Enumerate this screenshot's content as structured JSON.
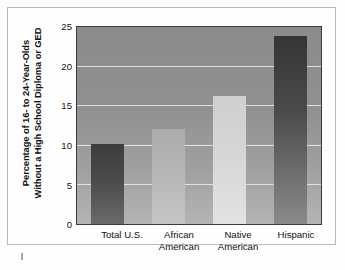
{
  "chart_data": {
    "type": "bar",
    "title": "",
    "xlabel": "",
    "ylabel": "Percentage of 16- to 24-Year-Olds Without a High School Diploma or GED",
    "ylabel_lines": [
      "Percentage of 16- to 24-Year-Olds",
      "Without a High School Diploma or GED"
    ],
    "categories": [
      "Total U.S.",
      "African American",
      "Native American",
      "Hispanic"
    ],
    "category_lines": [
      [
        "Total U.S.",
        ""
      ],
      [
        "African",
        "American"
      ],
      [
        "Native",
        "American"
      ],
      [
        "Hispanic"
      ]
    ],
    "values": [
      10.1,
      12.0,
      16.2,
      23.8
    ],
    "ylim": [
      0,
      25
    ],
    "yticks": [
      0,
      5,
      10,
      15,
      20,
      25
    ],
    "ytick_labels": [
      "0",
      "5",
      "10",
      "15",
      "20",
      "25"
    ],
    "grid": true,
    "legend": "none",
    "bar_colors": [
      "#4a4a4a",
      "#b6b6b6",
      "#d6d6d6",
      "#4b4b4b"
    ],
    "plot_background": "#949494",
    "gridline_color": "#e7e7e7",
    "frame_color": "#3a3a3a"
  }
}
